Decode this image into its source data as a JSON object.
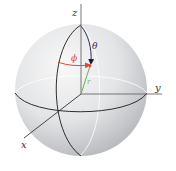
{
  "diagram": {
    "type": "spherical-coordinates",
    "axes": {
      "x": "x",
      "y": "y",
      "z": "z"
    },
    "angles": {
      "theta": "θ",
      "phi": "ϕ"
    },
    "radius": "r",
    "colors": {
      "sphere_light": "#f4f4f4",
      "sphere_mid": "#e0e0e2",
      "sphere_dark": "#b4b6ba",
      "great_circle": "#1a1a1a",
      "back_circle": "#ffffff",
      "axis": "#555555",
      "theta_arc": "#2a2f5a",
      "phi_arc": "#e0483a",
      "radius_vector": "#6bb04a",
      "phi_label": "#e0483a",
      "theta_label": "#2a2f5a",
      "axis_label": "#333333"
    }
  }
}
